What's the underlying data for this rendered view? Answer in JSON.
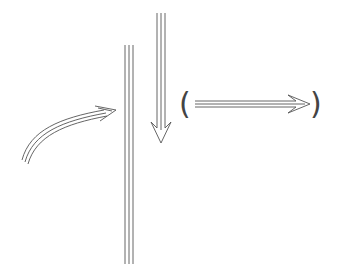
{
  "diagram": {
    "background": "#ffffff",
    "stroke_color": "#555555",
    "elements": [
      {
        "type": "curved-triple-arrow",
        "description": "curved arrow pointing toward vertical line",
        "from": [
          22,
          162
        ],
        "to": [
          116,
          110
        ]
      },
      {
        "type": "vertical-triple-line",
        "description": "long vertical triple line",
        "x": 129,
        "y_start": 45,
        "y_end": 264
      },
      {
        "type": "down-triple-arrow",
        "description": "downward arrow",
        "x": 161,
        "y_start": 13,
        "y_end": 143
      },
      {
        "type": "right-triple-arrow",
        "description": "rightward arrow enclosed in parentheses",
        "x_start": 195,
        "x_end": 310,
        "y": 104
      }
    ],
    "left_paren": "(",
    "right_paren": ")"
  }
}
